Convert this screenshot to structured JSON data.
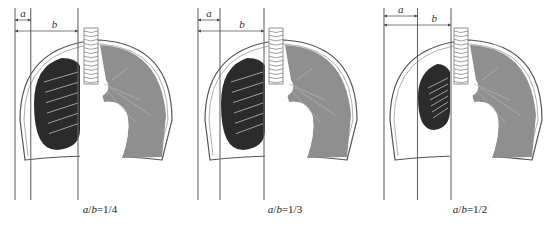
{
  "figure": {
    "dimension_labels": {
      "a": "a",
      "b": "b"
    },
    "colors": {
      "collapsed_lung": "#2b2b2b",
      "normal_lung": "#8f8f8f",
      "outline": "#555555",
      "airway": "#bdbdbd",
      "background": "#ffffff"
    },
    "panels": [
      {
        "id": "panel-1",
        "ratio_a": 1,
        "ratio_b": 4,
        "caption_a": "a",
        "caption_b": "b",
        "caption_value": "=1/4"
      },
      {
        "id": "panel-2",
        "ratio_a": 1,
        "ratio_b": 3,
        "caption_a": "a",
        "caption_b": "b",
        "caption_value": "=1/3"
      },
      {
        "id": "panel-3",
        "ratio_a": 1,
        "ratio_b": 2,
        "caption_a": "a",
        "caption_b": "b",
        "caption_value": "=1/2"
      }
    ]
  }
}
